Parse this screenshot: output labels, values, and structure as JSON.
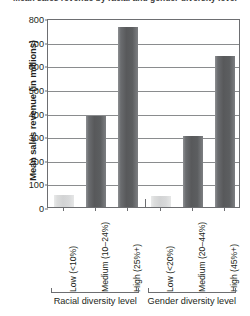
{
  "chart_data": {
    "type": "bar",
    "title": "Mean sales revenue by racial and gender diversity level",
    "xlabel": "",
    "ylabel": "Mean sales revenue (in millions)",
    "ylim": [
      0,
      800
    ],
    "yticks": [
      0,
      100,
      200,
      300,
      400,
      500,
      600,
      700,
      800
    ],
    "ytick_labels": [
      "0",
      "100",
      "200",
      "300",
      "400",
      "500",
      "600",
      "700",
      "800"
    ],
    "grid": true,
    "legend": "none",
    "categories": [
      "Low (<10%)",
      "Medium (10–24%)",
      "High (25%+)",
      "Low (<20%)",
      "Medium (20–44%)",
      "High (45%+)"
    ],
    "values": [
      50,
      385,
      760,
      45,
      300,
      640
    ],
    "bar_styles": [
      "light",
      "dark",
      "dark",
      "light",
      "dark",
      "dark"
    ],
    "groups": [
      {
        "label": "Racial diversity level",
        "start": 0,
        "end": 2
      },
      {
        "label": "Gender diversity level",
        "start": 3,
        "end": 5
      }
    ]
  },
  "colors": {
    "bar_dark": "#58595b",
    "bar_light": "#d2d3d4",
    "axis": "#6d6e71",
    "gridline": "#8a8c8e",
    "text": "#231f20",
    "background": "#ffffff"
  }
}
